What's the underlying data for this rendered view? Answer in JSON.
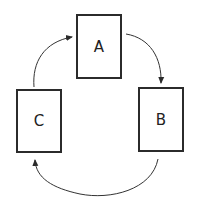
{
  "diagram": {
    "type": "cycle",
    "nodes": [
      {
        "id": "A",
        "label": "A"
      },
      {
        "id": "B",
        "label": "B"
      },
      {
        "id": "C",
        "label": "C"
      }
    ],
    "edges": [
      {
        "from": "A",
        "to": "B"
      },
      {
        "from": "B",
        "to": "C"
      },
      {
        "from": "C",
        "to": "A"
      }
    ],
    "stroke_color": "#2b2b2b",
    "background": "#ffffff"
  }
}
